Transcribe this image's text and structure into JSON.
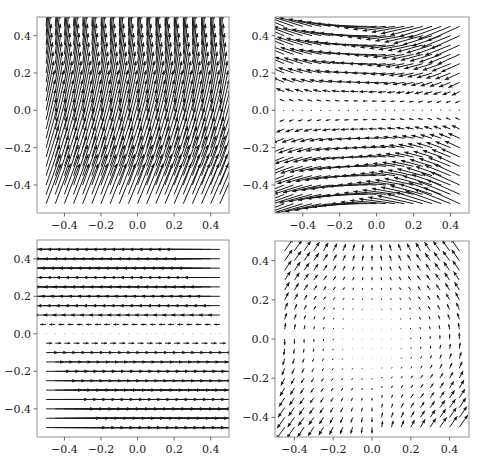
{
  "figure": {
    "width": 482,
    "height": 468,
    "layout": "2x2",
    "background": "#ffffff",
    "arrow_color": "#1a1a1a",
    "frame_color": "#888888"
  },
  "chart_data": [
    {
      "type": "quiver",
      "panel": "top-left",
      "title": "",
      "xlabel": "",
      "ylabel": "",
      "xlim": [
        -0.55,
        0.5
      ],
      "ylim": [
        -0.55,
        0.5
      ],
      "xticks": [
        -0.4,
        -0.2,
        0.0,
        0.2,
        0.4
      ],
      "yticks": [
        -0.4,
        -0.2,
        0.0,
        0.2,
        0.4
      ],
      "xticklabels": [
        "−0.4",
        "−0.2",
        "0.0",
        "0.2",
        "0.4"
      ],
      "yticklabels": [
        "−0.4",
        "−0.2",
        "0.0",
        "0.2",
        "0.4"
      ],
      "grid": {
        "x_start": -0.5,
        "x_stop": 0.45,
        "y_start": -0.5,
        "y_stop": 0.45,
        "step": 0.05
      },
      "field_description": "Long, nearly vertical arrows pointing upward with slight rightward tilt; tilt increases toward the bottom, arrows curve leftward at the top.",
      "field_model": "tl",
      "frame_px": {
        "left": 37,
        "top": 17,
        "right": 229,
        "bottom": 213
      }
    },
    {
      "type": "quiver",
      "panel": "top-right",
      "title": "",
      "xlabel": "",
      "ylabel": "",
      "xlim": [
        -0.55,
        0.5
      ],
      "ylim": [
        -0.55,
        0.5
      ],
      "xticks": [
        -0.4,
        -0.2,
        0.0,
        0.2,
        0.4
      ],
      "yticks": [
        -0.4,
        -0.2,
        0.0,
        0.2,
        0.4
      ],
      "xticklabels": [
        "−0.4",
        "−0.2",
        "0.0",
        "0.2",
        "0.4"
      ],
      "yticklabels": [
        "−0.4",
        "−0.2",
        "0.0",
        "0.2",
        "0.4"
      ],
      "grid": {
        "x_start": -0.5,
        "x_stop": 0.45,
        "y_start": -0.5,
        "y_stop": 0.45,
        "step": 0.05
      },
      "field_description": "Mostly horizontal arrows pointing left; magnitude grows with |y| and vanishes near y=0; slope varies with x (bowl-shaped streamlines).",
      "field_model": "tr",
      "frame_px": {
        "left": 275,
        "top": 17,
        "right": 469,
        "bottom": 213
      }
    },
    {
      "type": "quiver",
      "panel": "bottom-left",
      "title": "",
      "xlabel": "",
      "ylabel": "",
      "xlim": [
        -0.55,
        0.5
      ],
      "ylim": [
        -0.55,
        0.5
      ],
      "xticks": [
        -0.4,
        -0.2,
        0.0,
        0.2,
        0.4
      ],
      "yticks": [
        -0.4,
        -0.2,
        0.0,
        0.2,
        0.4
      ],
      "xticklabels": [
        "−0.4",
        "−0.2",
        "0.0",
        "0.2",
        "0.4"
      ],
      "yticklabels": [
        "−0.4",
        "−0.2",
        "0.0",
        "0.2",
        "0.4"
      ],
      "grid": {
        "x_start": -0.5,
        "x_stop": 0.45,
        "y_start": -0.5,
        "y_stop": 0.45,
        "step": 0.05
      },
      "field_description": "Purely horizontal shear flow: arrows point left for y>0 and right for y<0, magnitude proportional to |y|, near zero at y=0.",
      "field_model": "bl",
      "frame_px": {
        "left": 37,
        "top": 240,
        "right": 229,
        "bottom": 437
      }
    },
    {
      "type": "quiver",
      "panel": "bottom-right",
      "title": "",
      "xlabel": "",
      "ylabel": "",
      "xlim": [
        -0.5,
        0.5
      ],
      "ylim": [
        -0.5,
        0.5
      ],
      "xticks": [
        -0.4,
        -0.2,
        0.0,
        0.2,
        0.4
      ],
      "yticks": [
        -0.4,
        -0.2,
        0.0,
        0.2,
        0.4
      ],
      "xticklabels": [
        "−0.4",
        "−0.2",
        "0.0",
        "0.2",
        "0.4"
      ],
      "yticklabels": [
        "−0.4",
        "−0.2",
        "0.0",
        "0.2",
        "0.4"
      ],
      "grid": {
        "x_start": -0.45,
        "x_stop": 0.45,
        "y_start": -0.45,
        "y_stop": 0.48,
        "step": 0.05
      },
      "field_description": "Short arrows, near zero in the center, growing toward the corners; circulating/saddle-like pattern (upper-left arrows point up-left, lower-right point up-left, upper-right and lower-left point up-right/down-left).",
      "field_model": "br",
      "frame_px": {
        "left": 275,
        "top": 241,
        "right": 469,
        "bottom": 437
      }
    }
  ]
}
